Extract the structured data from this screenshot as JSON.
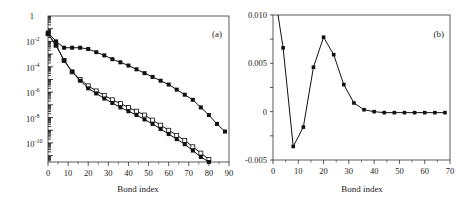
{
  "chart_data": [
    {
      "panel": "(a)",
      "type": "line",
      "xlabel": "Bond index",
      "ylabel": "",
      "yscale": "log",
      "xlim": [
        0,
        90
      ],
      "ylim_log10": [
        -11.5,
        0
      ],
      "xticks": [
        "0",
        "10",
        "20",
        "30",
        "40",
        "50",
        "60",
        "70",
        "80",
        "90"
      ],
      "yticks": [
        "1",
        "10^-2",
        "10^-4",
        "10^-6",
        "10^-8",
        "10^-10"
      ],
      "x": [
        0,
        4,
        8,
        12,
        16,
        20,
        24,
        28,
        32,
        36,
        40,
        44,
        48,
        52,
        56,
        60,
        64,
        68,
        72,
        76,
        80,
        84,
        88
      ],
      "series": [
        {
          "name": "filled-diamond (upper)",
          "marker": "filled",
          "log10_values": [
            -1.3,
            -2.0,
            -2.5,
            -2.5,
            -2.5,
            -2.6,
            -2.85,
            -3.1,
            -3.4,
            -3.65,
            -3.9,
            -4.2,
            -4.5,
            -4.8,
            -5.1,
            -5.4,
            -5.8,
            -6.2,
            -6.6,
            -7.2,
            -7.8,
            -8.5,
            -9.1
          ]
        },
        {
          "name": "open-square (middle)",
          "marker": "open",
          "log10_values": [
            -1.4,
            -2.3,
            -3.5,
            -4.4,
            -5.0,
            -5.5,
            -5.9,
            -6.25,
            -6.6,
            -6.9,
            -7.2,
            -7.5,
            -7.8,
            -8.2,
            -8.6,
            -9.0,
            -9.4,
            -9.8,
            -10.3,
            -10.8,
            -11.3,
            -11.8,
            null
          ]
        },
        {
          "name": "filled-square (lower)",
          "marker": "filled",
          "log10_values": [
            -1.4,
            -2.3,
            -3.5,
            -4.4,
            -5.1,
            -5.7,
            -6.1,
            -6.5,
            -6.85,
            -7.2,
            -7.5,
            -7.8,
            -8.15,
            -8.5,
            -8.9,
            -9.3,
            -9.7,
            -10.1,
            -10.6,
            -11.1,
            -11.6,
            null,
            null
          ]
        }
      ]
    },
    {
      "panel": "(b)",
      "type": "line",
      "xlabel": "Bond index",
      "ylabel": "",
      "xlim": [
        0,
        70
      ],
      "ylim": [
        -0.005,
        0.01
      ],
      "xticks": [
        "0",
        "10",
        "20",
        "30",
        "40",
        "50",
        "60",
        "70"
      ],
      "yticks": [
        "0.010",
        "0.005",
        "0",
        "-0.005"
      ],
      "x": [
        2,
        4,
        8,
        12,
        16,
        20,
        24,
        28,
        32,
        36,
        40,
        44,
        48,
        52,
        56,
        60,
        64,
        68
      ],
      "series": [
        {
          "name": "difference",
          "values": [
            0.0105,
            0.0066,
            -0.0036,
            -0.0016,
            0.0046,
            0.0077,
            0.0059,
            0.0028,
            0.0009,
            0.0002,
            0.0,
            -0.0001,
            -0.0001,
            -0.0001,
            -0.0001,
            -0.0001,
            -0.0001,
            -0.0001
          ]
        }
      ]
    }
  ],
  "labels": {
    "panel_a": "(a)",
    "panel_b": "(b)",
    "xlabel_a": "Bond index",
    "xlabel_b": "Bond index"
  }
}
